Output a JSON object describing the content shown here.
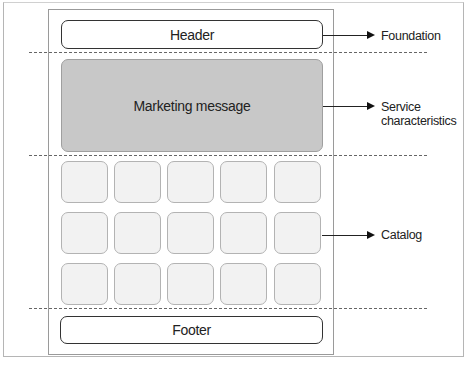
{
  "diagram": {
    "blocks": {
      "header": "Header",
      "marketing": "Marketing message",
      "footer": "Footer"
    },
    "catalog_grid": {
      "rows": 3,
      "cols": 5
    },
    "annotations": {
      "foundation": "Foundation",
      "service_line1": "Service",
      "service_line2": "characteristics",
      "catalog": "Catalog"
    },
    "colors": {
      "marketing_fill": "#c8c8c8",
      "tile_fill": "#f2f2f2",
      "border": "#333333"
    }
  }
}
